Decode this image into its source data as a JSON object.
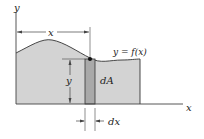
{
  "diagram": {
    "labels": {
      "y_axis": "y",
      "x_axis": "x",
      "x_dimension": "x",
      "y_dimension": "y",
      "function": "y = f(x)",
      "area_element": "dA",
      "width_element": "dx"
    },
    "colors": {
      "region_fill": "#d3d3d3",
      "strip_fill": "#a9a9a9",
      "outline": "#333333",
      "axis": "#444444",
      "background": "#ffffff"
    }
  }
}
